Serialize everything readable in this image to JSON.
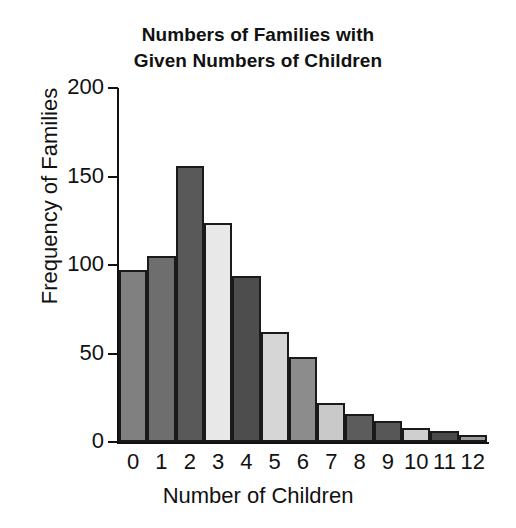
{
  "chart_data": {
    "type": "bar",
    "title": "Numbers of Families with Given Numbers of Children",
    "title_lines": [
      "Numbers of Families with",
      "Given Numbers of Children"
    ],
    "xlabel": "Number of Children",
    "ylabel": "Frequency of Families",
    "categories": [
      "0",
      "1",
      "2",
      "3",
      "4",
      "5",
      "6",
      "7",
      "8",
      "9",
      "10",
      "11",
      "12"
    ],
    "values": [
      97,
      105,
      156,
      124,
      94,
      62,
      48,
      22,
      16,
      12,
      8,
      6,
      4
    ],
    "bar_colors": [
      "#808080",
      "#6e6e6e",
      "#595959",
      "#e8e8e8",
      "#4d4d4d",
      "#d6d6d6",
      "#8c8c8c",
      "#c9c9c9",
      "#5c5c5c",
      "#575757",
      "#cfcfcf",
      "#4a4a4a",
      "#9a9a9a"
    ],
    "bar_edge_color": "#1a1a1a",
    "ylim": [
      0,
      200
    ],
    "yticks": [
      0,
      50,
      100,
      150,
      200
    ],
    "ytick_labels": [
      "0",
      "50",
      "100",
      "150",
      "200"
    ],
    "grid": false,
    "legend": false,
    "background_color": "#ffffff",
    "text_color": "#111111"
  }
}
